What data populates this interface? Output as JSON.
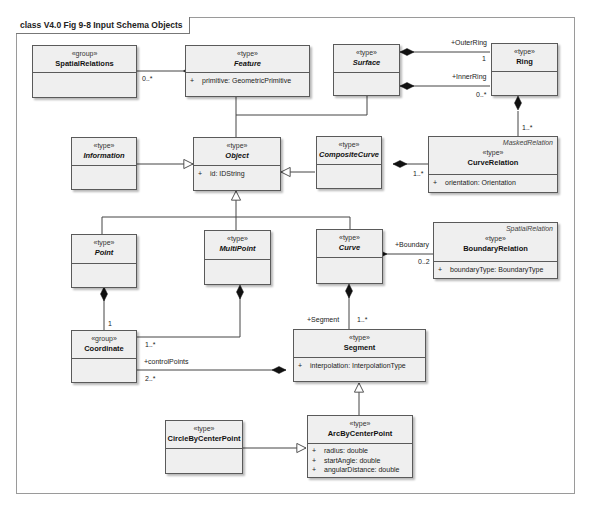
{
  "diagram": {
    "frame_title": "class V4.0 Fig 9-8 Input Schema Objects",
    "classes": {
      "spatial_relations": {
        "stereotype": "«group»",
        "name": "SpatialRelations"
      },
      "feature": {
        "stereotype": "«type»",
        "name": "Feature",
        "attributes": [
          {
            "visibility": "+",
            "text": "primitive:  GeometricPrimitive"
          }
        ]
      },
      "surface": {
        "stereotype": "«type»",
        "name": "Surface"
      },
      "ring": {
        "stereotype": "«type»",
        "name": "Ring"
      },
      "information": {
        "stereotype": "«type»",
        "name": "Information"
      },
      "object": {
        "stereotype": "«type»",
        "name": "Object",
        "attributes": [
          {
            "visibility": "+",
            "text": "id:  IDString"
          }
        ]
      },
      "composite_curve": {
        "stereotype": "«type»",
        "name": "CompositeCurve"
      },
      "curve_relation": {
        "tag": "MaskedRelation",
        "stereotype": "«type»",
        "name": "CurveRelation",
        "attributes": [
          {
            "visibility": "+",
            "text": "orientation:  Orientation"
          }
        ]
      },
      "point": {
        "stereotype": "«type»",
        "name": "Point"
      },
      "multi_point": {
        "stereotype": "«type»",
        "name": "MultiPoint"
      },
      "curve": {
        "stereotype": "«type»",
        "name": "Curve"
      },
      "boundary_relation": {
        "tag": "SpatialRelation",
        "stereotype": "«type»",
        "name": "BoundaryRelation",
        "attributes": [
          {
            "visibility": "+",
            "text": "boundaryType:  BoundaryType"
          }
        ]
      },
      "coordinate": {
        "stereotype": "«group»",
        "name": "Coordinate"
      },
      "segment": {
        "stereotype": "«type»",
        "name": "Segment",
        "attributes": [
          {
            "visibility": "+",
            "text": "interpolation:  InterpolationType"
          }
        ]
      },
      "circle_by_center_point": {
        "stereotype": "«type»",
        "name": "CircleByCenterPoint"
      },
      "arc_by_center_point": {
        "stereotype": "«type»",
        "name": "ArcByCenterPoint",
        "attributes": [
          {
            "visibility": "+",
            "text": "radius:  double"
          },
          {
            "visibility": "+",
            "text": "startAngle:  double"
          },
          {
            "visibility": "+",
            "text": "angularDistance:  double"
          }
        ]
      }
    },
    "labels": {
      "spatial_feature_mult": "0..*",
      "outer_ring_role": "+OuterRing",
      "outer_ring_mult": "1",
      "inner_ring_role": "+InnerRing",
      "inner_ring_mult": "0..*",
      "ring_curverel_mult": "1..*",
      "composite_curverel_mult": "1..*",
      "boundary_role": "+Boundary",
      "boundary_mult": "0..2",
      "point_coord_mult": "1",
      "multipoint_coord_mult": "1..*",
      "control_points_role": "+controlPoints",
      "control_points_mult": "2..*",
      "segment_role": "+Segment",
      "segment_mult": "1..*"
    }
  }
}
